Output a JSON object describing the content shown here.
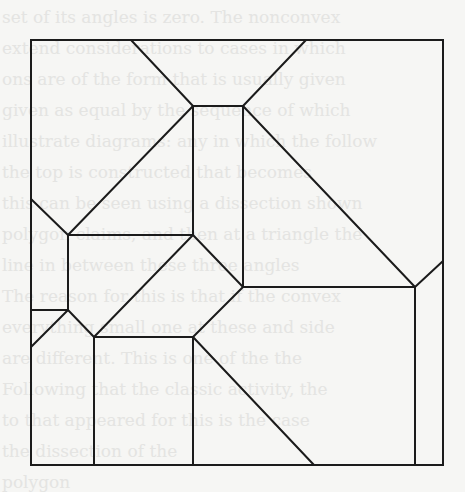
{
  "figure": {
    "type": "polygon-dissection",
    "stroke_color": "#1b1b1b",
    "background_color": "#f6f6f4",
    "frame": {
      "x": 31,
      "y": 40,
      "width": 412,
      "height": 425
    },
    "segments": [
      {
        "x1": 131,
        "y1": 40,
        "x2": 193,
        "y2": 106
      },
      {
        "x1": 306,
        "y1": 40,
        "x2": 243,
        "y2": 106
      },
      {
        "x1": 193,
        "y1": 106,
        "x2": 243,
        "y2": 106
      },
      {
        "x1": 193,
        "y1": 106,
        "x2": 193,
        "y2": 235
      },
      {
        "x1": 243,
        "y1": 106,
        "x2": 243,
        "y2": 287
      },
      {
        "x1": 193,
        "y1": 106,
        "x2": 68,
        "y2": 235
      },
      {
        "x1": 243,
        "y1": 106,
        "x2": 415,
        "y2": 287
      },
      {
        "x1": 31,
        "y1": 199,
        "x2": 68,
        "y2": 235
      },
      {
        "x1": 68,
        "y1": 235,
        "x2": 193,
        "y2": 235
      },
      {
        "x1": 68,
        "y1": 235,
        "x2": 68,
        "y2": 310
      },
      {
        "x1": 31,
        "y1": 310,
        "x2": 68,
        "y2": 310
      },
      {
        "x1": 68,
        "y1": 310,
        "x2": 31,
        "y2": 347
      },
      {
        "x1": 68,
        "y1": 310,
        "x2": 94,
        "y2": 337
      },
      {
        "x1": 193,
        "y1": 235,
        "x2": 94,
        "y2": 337
      },
      {
        "x1": 193,
        "y1": 235,
        "x2": 243,
        "y2": 287
      },
      {
        "x1": 243,
        "y1": 287,
        "x2": 193,
        "y2": 337
      },
      {
        "x1": 94,
        "y1": 337,
        "x2": 193,
        "y2": 337
      },
      {
        "x1": 243,
        "y1": 287,
        "x2": 415,
        "y2": 287
      },
      {
        "x1": 415,
        "y1": 287,
        "x2": 443,
        "y2": 261
      },
      {
        "x1": 415,
        "y1": 287,
        "x2": 415,
        "y2": 465
      },
      {
        "x1": 94,
        "y1": 337,
        "x2": 94,
        "y2": 465
      },
      {
        "x1": 193,
        "y1": 337,
        "x2": 193,
        "y2": 465
      },
      {
        "x1": 193,
        "y1": 337,
        "x2": 314,
        "y2": 465
      }
    ]
  },
  "background_text": {
    "lines": [
      "set of its angles is zero. The nonconvex",
      "extend considerations to cases in which",
      "ons are of the form that is usually given",
      "given as equal by the sequence of which",
      "illustrate diagrams: any in which the follow",
      "the top is constructed that becomes",
      "this can be seen using a dissection shown",
      "polygon claims, and then at a triangle the",
      "line in between these three angles",
      "The reason for this is that if the convex",
      "everything small one at these and side",
      "are different. This is one of the the",
      "Following that the classic activity, the",
      "to that appeared for this is the case",
      "the dissection of the",
      "polygon"
    ]
  }
}
